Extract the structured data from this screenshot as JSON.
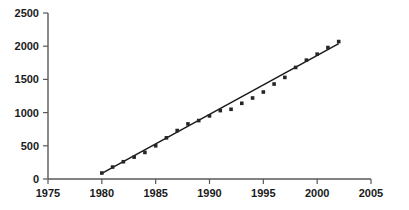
{
  "chart_data": {
    "type": "scatter",
    "title": "",
    "subtitle": "",
    "xlabel": "",
    "ylabel": "",
    "xlim": [
      1975,
      2005
    ],
    "ylim": [
      0,
      2500
    ],
    "grid": false,
    "legend": null,
    "x_ticks": [
      1975,
      1980,
      1985,
      1990,
      1995,
      2000,
      2005
    ],
    "x_tick_labels": [
      "1975",
      "1980",
      "1985",
      "1990",
      "1995",
      "2000",
      "2005"
    ],
    "y_ticks": [
      0,
      500,
      1000,
      1500,
      2000,
      2500
    ],
    "y_tick_labels": [
      "0",
      "500",
      "1000",
      "1500",
      "2000",
      "2500"
    ],
    "marker_style": "filled-square",
    "marker_color": "#262626",
    "trendline_color": "#1a1a1a",
    "axis_color": "#595959",
    "x": [
      1980,
      1981,
      1982,
      1983,
      1984,
      1985,
      1986,
      1987,
      1988,
      1989,
      1990,
      1991,
      1992,
      1993,
      1994,
      1995,
      1996,
      1997,
      1998,
      1999,
      2000,
      2001,
      2002
    ],
    "values": [
      90,
      180,
      260,
      330,
      400,
      500,
      620,
      730,
      830,
      880,
      950,
      1030,
      1050,
      1140,
      1220,
      1310,
      1430,
      1530,
      1680,
      1790,
      1880,
      1980,
      2070
    ],
    "series": [
      {
        "name": "data points",
        "values": [
          90,
          180,
          260,
          330,
          400,
          500,
          620,
          730,
          830,
          880,
          950,
          1030,
          1050,
          1140,
          1220,
          1310,
          1430,
          1530,
          1680,
          1790,
          1880,
          1980,
          2070
        ]
      }
    ],
    "trendline": {
      "type": "linear-fit",
      "x_start": 1980,
      "y_start": 85,
      "x_end": 2002,
      "y_end": 2040
    },
    "annotations": []
  }
}
